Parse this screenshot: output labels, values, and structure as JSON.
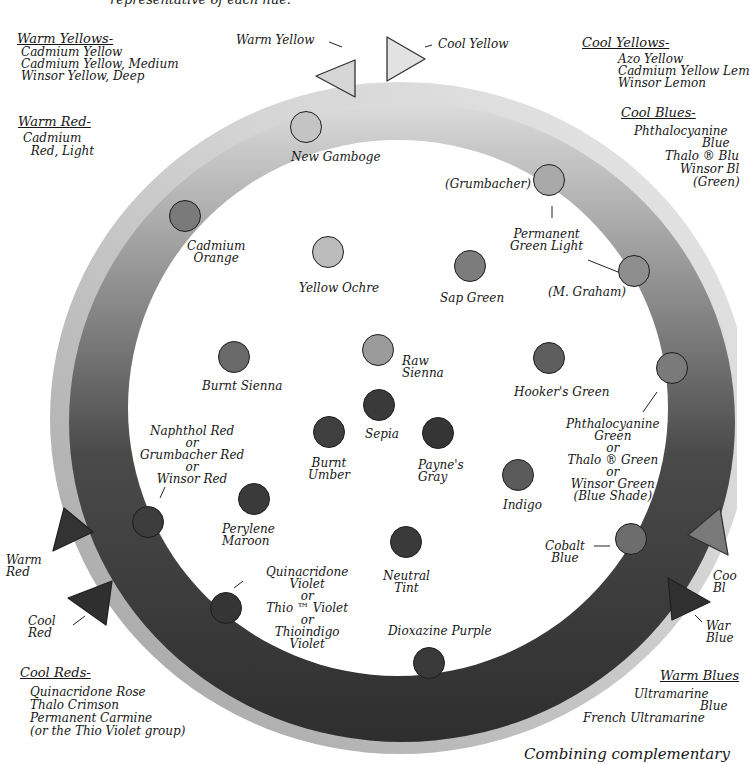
{
  "header_fragment": "representative of each hue.",
  "groups": {
    "warm_yellows": {
      "heading": "Warm Yellows-",
      "items": [
        "Cadmium Yellow",
        "Cadmium Yellow, Medium",
        "Winsor Yellow, Deep"
      ]
    },
    "warm_red": {
      "heading": "Warm Red-",
      "items": [
        "Cadmium",
        "  Red, Light"
      ]
    },
    "cool_yellows": {
      "heading": "Cool Yellows-",
      "items": [
        "Azo Yellow",
        "Cadmium Yellow Lem",
        "Winsor Lemon"
      ]
    },
    "cool_blues": {
      "heading": "Cool Blues-",
      "items": [
        "Phthalocyanine",
        "Blue",
        "Thalo ® Blu",
        "Winsor Bl",
        "(Green)"
      ]
    },
    "cool_reds": {
      "heading": "Cool Reds-",
      "items": [
        "Quinacridone Rose",
        "Thalo Crimson",
        "Permanent Carmine",
        "(or the Thio Violet group)"
      ]
    },
    "warm_blues": {
      "heading": "Warm Blues",
      "items": [
        "Ultramarine",
        "Blue",
        "French Ultramarine"
      ]
    }
  },
  "markers": {
    "warm_yellow": "Warm Yellow",
    "cool_yellow": "Cool Yellow",
    "warm_red": "Warm\nRed",
    "cool_red": "Cool\nRed",
    "cool_blue": "Coo\nBl",
    "warm_blue": "War\nBlue"
  },
  "swatches": [
    {
      "id": "new-gamboge",
      "label": "New Gamboge",
      "x": 306,
      "y": 127,
      "shade": "#c4c4c4"
    },
    {
      "id": "grumbacher-green",
      "label": "(Grumbacher)",
      "x": 549,
      "y": 180,
      "shade": "#a9a9a9"
    },
    {
      "id": "cadmium-orange",
      "label": "Cadmium\nOrange",
      "x": 185,
      "y": 216,
      "shade": "#7a7a7a"
    },
    {
      "id": "yellow-ochre",
      "label": "Yellow Ochre",
      "x": 328,
      "y": 252,
      "shade": "#bcbcbc"
    },
    {
      "id": "sap-green",
      "label": "Sap Green",
      "x": 470,
      "y": 266,
      "shade": "#7c7c7c"
    },
    {
      "id": "m-graham-green",
      "label": "(M. Graham)",
      "x": 634,
      "y": 271,
      "shade": "#8e8e8e"
    },
    {
      "id": "permanent-green-light",
      "label": "Permanent\nGreen Light",
      "x": null,
      "y": null,
      "shade": null
    },
    {
      "id": "raw-sienna",
      "label": "Raw\nSienna",
      "x": 378,
      "y": 350,
      "shade": "#9b9b9b"
    },
    {
      "id": "burnt-sienna",
      "label": "Burnt Sienna",
      "x": 234,
      "y": 357,
      "shade": "#6a6a6a"
    },
    {
      "id": "hookers-green",
      "label": "Hooker's Green",
      "x": 549,
      "y": 358,
      "shade": "#5e5e5e"
    },
    {
      "id": "phthalo-green",
      "label": "Phthalocyanine\nGreen\nor\nThalo ® Green\nor\nWinsor Green\n(Blue Shade)",
      "x": 672,
      "y": 368,
      "shade": "#7a7a7a"
    },
    {
      "id": "sepia",
      "label": "Sepia",
      "x": 379,
      "y": 405,
      "shade": "#3a3a3a"
    },
    {
      "id": "burnt-umber",
      "label": "Burnt\nUmber",
      "x": 329,
      "y": 432,
      "shade": "#3f3f3f"
    },
    {
      "id": "paynes-gray",
      "label": "Payne's\nGray",
      "x": 438,
      "y": 433,
      "shade": "#353535"
    },
    {
      "id": "indigo",
      "label": "Indigo",
      "x": 518,
      "y": 475,
      "shade": "#5a5a5a"
    },
    {
      "id": "perylene-maroon",
      "label": "Perylene\nMaroon",
      "x": 254,
      "y": 499,
      "shade": "#3a3a3a"
    },
    {
      "id": "naphthol-red",
      "label": "Naphthol Red\nor\nGrumbacher Red\nor\nWinsor Red",
      "x": 148,
      "y": 522,
      "shade": "#3c3c3c"
    },
    {
      "id": "cobalt-blue",
      "label": "Cobalt\nBlue",
      "x": 631,
      "y": 539,
      "shade": "#6d6d6d"
    },
    {
      "id": "neutral-tint",
      "label": "Neutral\nTint",
      "x": 406,
      "y": 542,
      "shade": "#3a3a3a"
    },
    {
      "id": "quinacridone-violet",
      "label": "Quinacridone\nViolet\nor\nThio ™ Violet\nor\nThioindigo\nViolet",
      "x": 226,
      "y": 608,
      "shade": "#353535"
    },
    {
      "id": "dioxazine-purple",
      "label": "Dioxazine Purple",
      "x": 429,
      "y": 663,
      "shade": "#3a3a3a"
    }
  ],
  "footer_fragment": "Combining complementary"
}
